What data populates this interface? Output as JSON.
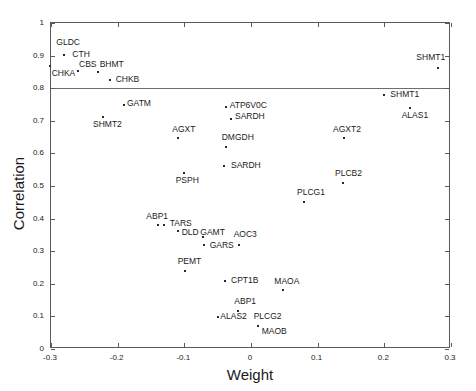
{
  "chart_data": {
    "type": "scatter",
    "title": "",
    "xlabel": "Weight",
    "ylabel": "Correlation",
    "xlim": [
      -0.3,
      0.3
    ],
    "ylim": [
      0,
      1
    ],
    "xticks": [
      -0.3,
      -0.2,
      -0.1,
      0,
      0.1,
      0.2,
      0.3
    ],
    "xticklabels": [
      "-0.3",
      "-0.2",
      "-0.1",
      "0",
      "0.1",
      "0.2",
      "0.3"
    ],
    "yticks": [
      0,
      0.1,
      0.2,
      0.3,
      0.4,
      0.5,
      0.6,
      0.7,
      0.8,
      0.9,
      1
    ],
    "yticklabels": [
      "0",
      "0.1",
      "0.2",
      "0.3",
      "0.4",
      "0.5",
      "0.6",
      "0.7",
      "0.8",
      "0.9",
      "1"
    ],
    "grid": false,
    "legend": null,
    "marker_color": "#2a2a2a",
    "axis_color": "#5a5a5a",
    "annotations": [
      {
        "type": "hline",
        "y": 0.8,
        "label": "",
        "color": "#6e6e6e"
      }
    ],
    "points": [
      {
        "label": "GLDC",
        "x": -0.281,
        "y": 0.903,
        "lx": -0.292,
        "ly": 0.94,
        "anchor": "left"
      },
      {
        "label": "CTH",
        "x": -0.281,
        "y": 0.903,
        "lx": -0.268,
        "ly": 0.903,
        "anchor": "left"
      },
      {
        "label": "CHKA",
        "x": -0.301,
        "y": 0.869,
        "lx": -0.299,
        "ly": 0.845,
        "anchor": "left"
      },
      {
        "label": "CBS",
        "x": -0.259,
        "y": 0.853,
        "lx": -0.258,
        "ly": 0.872,
        "anchor": "left"
      },
      {
        "label": "BHMT",
        "x": -0.229,
        "y": 0.851,
        "lx": -0.227,
        "ly": 0.872,
        "anchor": "left"
      },
      {
        "label": "CHKB",
        "x": -0.212,
        "y": 0.826,
        "lx": -0.203,
        "ly": 0.826,
        "anchor": "left"
      },
      {
        "label": "SHMT1",
        "x": 0.28,
        "y": 0.862,
        "lx": 0.248,
        "ly": 0.893,
        "anchor": "left"
      },
      {
        "label": "SHMT1",
        "x": 0.2,
        "y": 0.778,
        "lx": 0.209,
        "ly": 0.778,
        "anchor": "left"
      },
      {
        "label": "ALAS1",
        "x": 0.239,
        "y": 0.74,
        "lx": 0.226,
        "ly": 0.714,
        "anchor": "left"
      },
      {
        "label": "GATM",
        "x": -0.191,
        "y": 0.748,
        "lx": -0.186,
        "ly": 0.752,
        "anchor": "left"
      },
      {
        "label": "SHMT2",
        "x": -0.222,
        "y": 0.712,
        "lx": -0.237,
        "ly": 0.687,
        "anchor": "left"
      },
      {
        "label": "ATP6V0C",
        "x": -0.038,
        "y": 0.741,
        "lx": -0.032,
        "ly": 0.745,
        "anchor": "left"
      },
      {
        "label": "SARDH",
        "x": -0.03,
        "y": 0.707,
        "lx": -0.024,
        "ly": 0.711,
        "anchor": "left"
      },
      {
        "label": "AGXT",
        "x": -0.11,
        "y": 0.646,
        "lx": -0.118,
        "ly": 0.673,
        "anchor": "left"
      },
      {
        "label": "AGXT2",
        "x": 0.139,
        "y": 0.646,
        "lx": 0.123,
        "ly": 0.673,
        "anchor": "left"
      },
      {
        "label": "DMGDH",
        "x": -0.037,
        "y": 0.62,
        "lx": -0.044,
        "ly": 0.646,
        "anchor": "left"
      },
      {
        "label": "SARDH",
        "x": -0.04,
        "y": 0.56,
        "lx": -0.03,
        "ly": 0.56,
        "anchor": "left"
      },
      {
        "label": "PSPH",
        "x": -0.101,
        "y": 0.54,
        "lx": -0.113,
        "ly": 0.514,
        "anchor": "left"
      },
      {
        "label": "PLCB2",
        "x": 0.138,
        "y": 0.509,
        "lx": 0.126,
        "ly": 0.536,
        "anchor": "left"
      },
      {
        "label": "PLCG1",
        "x": 0.08,
        "y": 0.452,
        "lx": 0.069,
        "ly": 0.478,
        "anchor": "left"
      },
      {
        "label": "ABP1",
        "x": -0.139,
        "y": 0.38,
        "lx": -0.157,
        "ly": 0.404,
        "anchor": "left"
      },
      {
        "label": "TARS",
        "x": -0.13,
        "y": 0.38,
        "lx": -0.122,
        "ly": 0.382,
        "anchor": "left"
      },
      {
        "label": "DLD",
        "x": -0.11,
        "y": 0.363,
        "lx": -0.104,
        "ly": 0.355,
        "anchor": "left"
      },
      {
        "label": "GAMT",
        "x": -0.072,
        "y": 0.344,
        "lx": -0.076,
        "ly": 0.355,
        "anchor": "left"
      },
      {
        "label": "GARS",
        "x": -0.071,
        "y": 0.318,
        "lx": -0.062,
        "ly": 0.315,
        "anchor": "left"
      },
      {
        "label": "AOC3",
        "x": -0.018,
        "y": 0.32,
        "lx": -0.026,
        "ly": 0.349,
        "anchor": "left"
      },
      {
        "label": "PEMT",
        "x": -0.099,
        "y": 0.24,
        "lx": -0.11,
        "ly": 0.268,
        "anchor": "left"
      },
      {
        "label": "CPT1B",
        "x": -0.039,
        "y": 0.209,
        "lx": -0.03,
        "ly": 0.209,
        "anchor": "left"
      },
      {
        "label": "MAOA",
        "x": 0.048,
        "y": 0.18,
        "lx": 0.035,
        "ly": 0.207,
        "anchor": "left"
      },
      {
        "label": "ABP1",
        "x": -0.019,
        "y": 0.118,
        "lx": -0.025,
        "ly": 0.145,
        "anchor": "left"
      },
      {
        "label": "ALAS2",
        "x": -0.05,
        "y": 0.098,
        "lx": -0.046,
        "ly": 0.098,
        "anchor": "left"
      },
      {
        "label": "PLCG2",
        "x": 0.01,
        "y": 0.07,
        "lx": 0.004,
        "ly": 0.098,
        "anchor": "left"
      },
      {
        "label": "MAOB",
        "x": 0.01,
        "y": 0.07,
        "lx": 0.016,
        "ly": 0.053,
        "anchor": "left"
      }
    ]
  }
}
